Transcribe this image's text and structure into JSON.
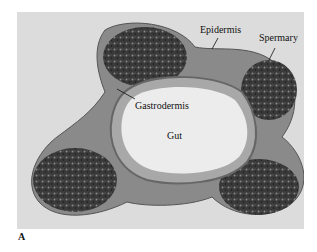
{
  "figure": {
    "panel_label": "A",
    "labels": {
      "epidermis": "Epidermis",
      "spermary": "Spermary",
      "gastrodermis": "Gastrodermis",
      "gut": "Gut"
    },
    "colors": {
      "background": "#dcdcdc",
      "tissue_dark": "#2a2a2a",
      "tissue_mid": "#7a7a7a",
      "gut_lumen": "#ececec"
    }
  }
}
